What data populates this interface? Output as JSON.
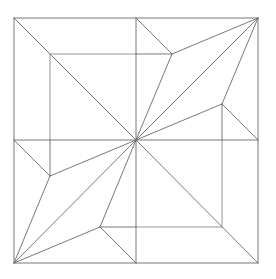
{
  "diagram": {
    "type": "crease-pattern",
    "background": "#ffffff",
    "line_color": "#6a6a6a",
    "lines": [
      {
        "id": "outer-top",
        "x1": 14,
        "y1": 18,
        "x2": 258,
        "y2": 18
      },
      {
        "id": "outer-right",
        "x1": 258,
        "y1": 18,
        "x2": 258,
        "y2": 263
      },
      {
        "id": "outer-bottom",
        "x1": 14,
        "y1": 263,
        "x2": 258,
        "y2": 263
      },
      {
        "id": "outer-left",
        "x1": 14,
        "y1": 18,
        "x2": 14,
        "y2": 263
      },
      {
        "id": "mid-vertical",
        "x1": 136,
        "y1": 18,
        "x2": 136,
        "y2": 263
      },
      {
        "id": "mid-horizontal",
        "x1": 14,
        "y1": 140,
        "x2": 258,
        "y2": 140
      },
      {
        "id": "diag-tl-center",
        "x1": 14,
        "y1": 18,
        "x2": 136,
        "y2": 140
      },
      {
        "id": "diag-center-br",
        "x1": 136,
        "y1": 140,
        "x2": 258,
        "y2": 263
      },
      {
        "id": "diag-tr-center",
        "x1": 258,
        "y1": 18,
        "x2": 136,
        "y2": 140
      },
      {
        "id": "diag-center-bl",
        "x1": 136,
        "y1": 140,
        "x2": 14,
        "y2": 263
      },
      {
        "id": "inner-tl-top",
        "x1": 50,
        "y1": 54,
        "x2": 136,
        "y2": 54
      },
      {
        "id": "inner-tl-left",
        "x1": 50,
        "y1": 54,
        "x2": 50,
        "y2": 140
      },
      {
        "id": "inner-br-bottom",
        "x1": 136,
        "y1": 227,
        "x2": 222,
        "y2": 227
      },
      {
        "id": "inner-br-right",
        "x1": 222,
        "y1": 140,
        "x2": 222,
        "y2": 227
      },
      {
        "id": "tr-kite-a-top",
        "x1": 136,
        "y1": 18,
        "x2": 172,
        "y2": 54
      },
      {
        "id": "tr-kite-a-horiz",
        "x1": 136,
        "y1": 54,
        "x2": 172,
        "y2": 54
      },
      {
        "id": "tr-kite-a-to-corner",
        "x1": 172,
        "y1": 54,
        "x2": 258,
        "y2": 18
      },
      {
        "id": "tr-kite-a-to-center",
        "x1": 172,
        "y1": 54,
        "x2": 136,
        "y2": 140
      },
      {
        "id": "tr-kite-b-to-corner",
        "x1": 222,
        "y1": 104,
        "x2": 258,
        "y2": 18
      },
      {
        "id": "tr-kite-b-to-center",
        "x1": 222,
        "y1": 104,
        "x2": 136,
        "y2": 140
      },
      {
        "id": "tr-kite-b-vert",
        "x1": 222,
        "y1": 104,
        "x2": 222,
        "y2": 140
      },
      {
        "id": "tr-kite-b-right",
        "x1": 222,
        "y1": 104,
        "x2": 258,
        "y2": 140
      },
      {
        "id": "bl-kite-a-left",
        "x1": 14,
        "y1": 140,
        "x2": 50,
        "y2": 176
      },
      {
        "id": "bl-kite-a-vert",
        "x1": 50,
        "y1": 140,
        "x2": 50,
        "y2": 176
      },
      {
        "id": "bl-kite-a-to-center",
        "x1": 50,
        "y1": 176,
        "x2": 136,
        "y2": 140
      },
      {
        "id": "bl-kite-a-to-corner",
        "x1": 50,
        "y1": 176,
        "x2": 14,
        "y2": 263
      },
      {
        "id": "bl-kite-b-to-center",
        "x1": 100,
        "y1": 227,
        "x2": 136,
        "y2": 140
      },
      {
        "id": "bl-kite-b-to-corner",
        "x1": 100,
        "y1": 227,
        "x2": 14,
        "y2": 263
      },
      {
        "id": "bl-kite-b-horiz",
        "x1": 100,
        "y1": 227,
        "x2": 136,
        "y2": 227
      },
      {
        "id": "bl-kite-b-bottom",
        "x1": 100,
        "y1": 227,
        "x2": 136,
        "y2": 263
      }
    ]
  }
}
